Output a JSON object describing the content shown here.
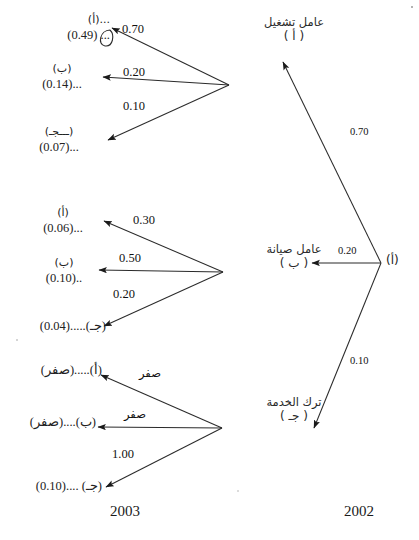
{
  "meta": {
    "ink_color": "#1a1a1a"
  },
  "years": {
    "left_year": "2003",
    "right_year": "2002"
  },
  "right_nodes": [
    {
      "id": "operator",
      "name_ar": "عامل تشغيل",
      "code_ar": "( أ )"
    },
    {
      "id": "maintenance",
      "name_ar": "عامل صيانة",
      "code_ar": "( ب )"
    },
    {
      "id": "leave",
      "name_ar": "ترك الخدمة",
      "code_ar": "( جـ )"
    }
  ],
  "right_vertex_label": "(أ)",
  "right_edges": [
    {
      "from": "origin",
      "to": "operator",
      "weight": "0.70"
    },
    {
      "from": "origin",
      "to": "maintenance",
      "weight": "0.20"
    },
    {
      "from": "origin",
      "to": "leave",
      "weight": "0.10"
    }
  ],
  "groups": [
    {
      "id": "group-operator",
      "source": "operator",
      "edges": [
        {
          "weight": "0.70",
          "target": "a"
        },
        {
          "weight": "0.20",
          "target": "b"
        },
        {
          "weight": "0.10",
          "target": "c"
        }
      ],
      "targets": [
        {
          "id": "a",
          "line1": "...(أ)",
          "line2": "(0.49) ..."
        },
        {
          "id": "b",
          "line1": "(ب)",
          "line2": "(0.14)..."
        },
        {
          "id": "c",
          "line1": "(ـــجـ)",
          "line2": "(0.07)..."
        }
      ]
    },
    {
      "id": "group-maintenance",
      "source": "maintenance",
      "edges": [
        {
          "weight": "0.30",
          "target": "a"
        },
        {
          "weight": "0.50",
          "target": "b"
        },
        {
          "weight": "0.20",
          "target": "c"
        }
      ],
      "targets": [
        {
          "id": "a",
          "line1": "(أ)",
          "line2": "(0.06)..."
        },
        {
          "id": "b",
          "line1": "(ب)",
          "line2": "(0.10).."
        },
        {
          "id": "c",
          "line1": "",
          "line2": "(0.04).....(جـ)"
        }
      ]
    },
    {
      "id": "group-leave",
      "source": "leave",
      "edges": [
        {
          "weight": "صفر",
          "target": "a"
        },
        {
          "weight": "صفر",
          "target": "b"
        },
        {
          "weight": "1.00",
          "target": "c"
        }
      ],
      "targets": [
        {
          "id": "a",
          "line1": "",
          "line2": "(صفر).....(أ)"
        },
        {
          "id": "b",
          "line1": "",
          "line2": "(صفر)....(ب)"
        },
        {
          "id": "c",
          "line1": "",
          "line2": "(0.10).... (جـ)"
        }
      ]
    }
  ]
}
